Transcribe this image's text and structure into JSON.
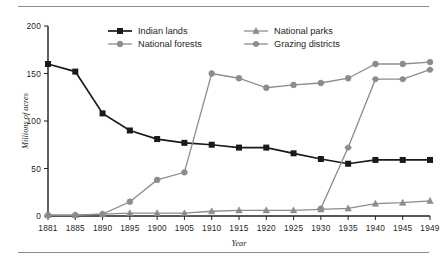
{
  "figure": {
    "background": "#ffffff",
    "has_top_rule": true,
    "has_bottom_rule": true
  },
  "chart_data": {
    "type": "line",
    "title": "",
    "xlabel": "Year",
    "ylabel": "Millions of acres",
    "xlim": [
      "1881",
      "1949"
    ],
    "ylim": [
      0,
      200
    ],
    "yticks": [
      0,
      50,
      100,
      150,
      200
    ],
    "grid": false,
    "legend_position": "top-inside",
    "categories": [
      "1881",
      "1885",
      "1890",
      "1895",
      "1900",
      "1905",
      "1910",
      "1915",
      "1920",
      "1925",
      "1930",
      "1935",
      "1940",
      "1945",
      "1949"
    ],
    "series": [
      {
        "name": "Indian lands",
        "color": "#1a1a1a",
        "marker": "square",
        "values": [
          160,
          152,
          108,
          90,
          81,
          77,
          75,
          72,
          72,
          66,
          60,
          55,
          59,
          59,
          59
        ]
      },
      {
        "name": "National forests",
        "color": "#8c8c8c",
        "marker": "circle",
        "values": [
          1,
          1,
          2,
          15,
          38,
          46,
          150,
          145,
          135,
          138,
          140,
          145,
          160,
          160,
          162
        ]
      },
      {
        "name": "National parks",
        "color": "#8c8c8c",
        "marker": "triangle",
        "values": [
          1,
          1,
          2,
          3,
          3,
          3,
          5,
          6,
          6,
          6,
          7,
          8,
          13,
          14,
          16
        ]
      },
      {
        "name": "Grazing districts",
        "color": "#8c8c8c",
        "marker": "circle-plus",
        "values": [
          null,
          null,
          null,
          null,
          null,
          null,
          null,
          null,
          null,
          null,
          8,
          72,
          144,
          144,
          154
        ]
      }
    ]
  },
  "legend": {
    "entries": [
      {
        "label": "Indian lands",
        "marker": "square",
        "color": "#1a1a1a"
      },
      {
        "label": "National forests",
        "marker": "circle",
        "color": "#8c8c8c"
      },
      {
        "label": "National parks",
        "marker": "triangle",
        "color": "#8c8c8c"
      },
      {
        "label": "Grazing districts",
        "marker": "circle-plus",
        "color": "#8c8c8c"
      }
    ]
  }
}
